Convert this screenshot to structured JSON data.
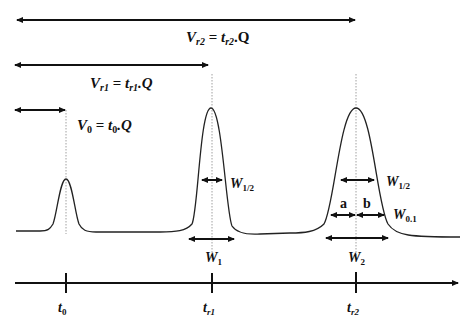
{
  "diagram": {
    "labels": {
      "vr2": {
        "main": "V",
        "sub": "r2",
        "eq": " = ",
        "t": "t",
        "tsub": "r2",
        "tail": ".Q"
      },
      "vr1": {
        "main": "V",
        "sub": "r1",
        "eq": " = ",
        "t": "t",
        "tsub": "r1",
        "tail": ".Q"
      },
      "v0": {
        "main": "V",
        "sub": "0",
        "eq": " = ",
        "t": "t",
        "tsub": "0",
        "tail": ".Q"
      },
      "w_half_1": {
        "main": "W",
        "sub": "1/2"
      },
      "w1": {
        "main": "W",
        "sub": "1"
      },
      "w_half_2": {
        "main": "W",
        "sub": "1/2"
      },
      "w01": {
        "main": "W",
        "sub": "0.1"
      },
      "a": "a",
      "b": "b",
      "w2": {
        "main": "W",
        "sub": "2"
      }
    },
    "axis": {
      "ticks": [
        {
          "main": "t",
          "sub": "0"
        },
        {
          "main": "t",
          "sub": "r1"
        },
        {
          "main": "t",
          "sub": "r2"
        }
      ]
    },
    "peaks": [
      {
        "name": "unretained",
        "position": "t0",
        "relative_height": 0.45
      },
      {
        "name": "peak-1",
        "position": "tr1",
        "relative_height": 1.0
      },
      {
        "name": "peak-2",
        "position": "tr2",
        "relative_height": 1.0
      }
    ]
  }
}
